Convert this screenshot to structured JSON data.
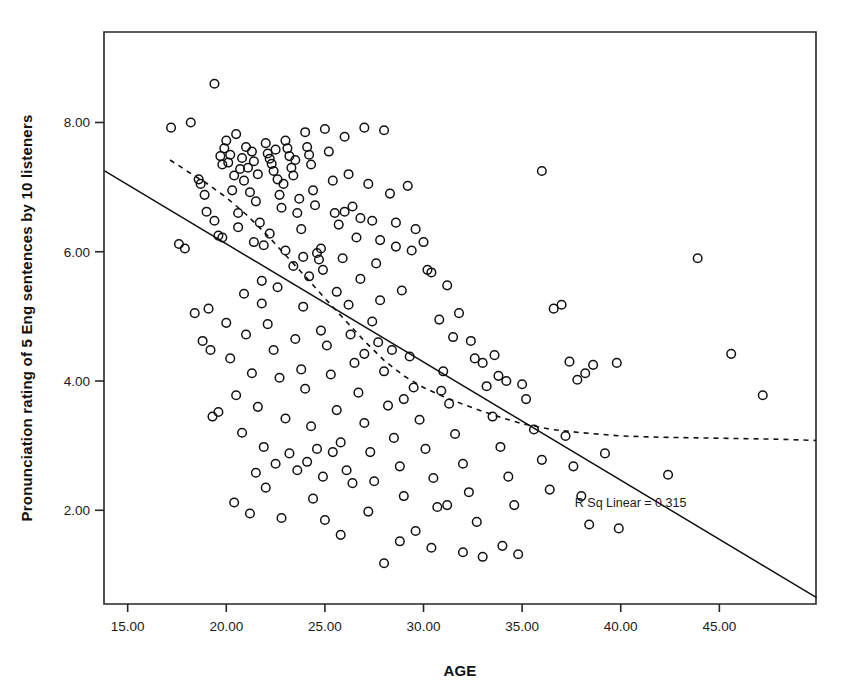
{
  "chart_data": {
    "type": "scatter",
    "title": "",
    "subtitle": "",
    "xlabel": "AGE",
    "ylabel": "Pronunciation rating of 5 Eng sentences by 10 listeners",
    "xlim": [
      13.8,
      49.9
    ],
    "ylim": [
      0.55,
      9.4
    ],
    "xticks": [
      15,
      20,
      25,
      30,
      35,
      40,
      45
    ],
    "xtick_labels": [
      "15.00",
      "20.00",
      "25.00",
      "30.00",
      "35.00",
      "40.00",
      "45.00"
    ],
    "yticks": [
      2,
      4,
      6,
      8
    ],
    "ytick_labels": [
      "2.00",
      "4.00",
      "6.00",
      "8.00"
    ],
    "grid": false,
    "legend": "none",
    "marker": "open-circle",
    "marker_color": "#111111",
    "annotations": [
      {
        "name": "r-squared-label",
        "text": "R Sq Linear = 0.315",
        "x": 40.5,
        "y": 2.05
      }
    ],
    "fit_line": {
      "name": "linear-fit",
      "style": "solid",
      "x": [
        13.83,
        49.93
      ],
      "y": [
        7.25,
        0.65
      ],
      "r_squared": 0.315
    },
    "loess_line": {
      "name": "loess-fit",
      "style": "dotted",
      "x": [
        17.15,
        18.0,
        19.0,
        20.0,
        21.0,
        22.0,
        23.0,
        24.0,
        25.0,
        26.0,
        27.0,
        28.0,
        29.0,
        30.0,
        31.0,
        32.0,
        33.0,
        34.0,
        35.0,
        36.5,
        38.0,
        40.0,
        42.0,
        44.0,
        46.0,
        48.0,
        49.9
      ],
      "y": [
        7.42,
        7.25,
        7.06,
        6.84,
        6.58,
        6.28,
        5.95,
        5.62,
        5.28,
        4.95,
        4.62,
        4.32,
        4.08,
        3.9,
        3.76,
        3.64,
        3.53,
        3.43,
        3.34,
        3.25,
        3.2,
        3.15,
        3.13,
        3.12,
        3.11,
        3.1,
        3.08
      ]
    },
    "points": [
      [
        17.2,
        7.92
      ],
      [
        17.6,
        6.12
      ],
      [
        17.9,
        6.05
      ],
      [
        18.2,
        8.0
      ],
      [
        18.6,
        7.12
      ],
      [
        18.7,
        7.05
      ],
      [
        18.9,
        6.88
      ],
      [
        19.1,
        5.12
      ],
      [
        19.3,
        3.45
      ],
      [
        19.4,
        8.6
      ],
      [
        19.6,
        6.25
      ],
      [
        19.7,
        7.48
      ],
      [
        19.8,
        7.35
      ],
      [
        19.9,
        7.6
      ],
      [
        20.0,
        7.72
      ],
      [
        20.1,
        7.38
      ],
      [
        20.2,
        7.5
      ],
      [
        20.3,
        6.95
      ],
      [
        20.4,
        7.18
      ],
      [
        20.5,
        7.82
      ],
      [
        20.6,
        6.6
      ],
      [
        20.7,
        7.28
      ],
      [
        20.8,
        7.45
      ],
      [
        20.9,
        7.1
      ],
      [
        21.0,
        7.62
      ],
      [
        21.1,
        7.3
      ],
      [
        21.2,
        6.92
      ],
      [
        21.3,
        7.55
      ],
      [
        21.4,
        7.4
      ],
      [
        21.5,
        6.78
      ],
      [
        21.6,
        7.2
      ],
      [
        21.7,
        6.45
      ],
      [
        21.8,
        5.55
      ],
      [
        21.9,
        6.1
      ],
      [
        22.0,
        7.68
      ],
      [
        22.1,
        7.52
      ],
      [
        22.2,
        7.44
      ],
      [
        22.3,
        7.36
      ],
      [
        22.4,
        7.25
      ],
      [
        22.5,
        7.58
      ],
      [
        22.6,
        7.12
      ],
      [
        22.7,
        6.88
      ],
      [
        22.8,
        6.68
      ],
      [
        22.9,
        7.05
      ],
      [
        23.0,
        7.72
      ],
      [
        23.1,
        7.6
      ],
      [
        23.2,
        7.48
      ],
      [
        23.3,
        7.3
      ],
      [
        23.4,
        7.18
      ],
      [
        23.5,
        7.42
      ],
      [
        23.6,
        6.6
      ],
      [
        23.7,
        6.82
      ],
      [
        23.8,
        6.35
      ],
      [
        23.9,
        5.92
      ],
      [
        24.0,
        7.85
      ],
      [
        24.1,
        7.62
      ],
      [
        24.2,
        7.5
      ],
      [
        24.3,
        7.35
      ],
      [
        24.4,
        6.95
      ],
      [
        24.5,
        6.72
      ],
      [
        24.6,
        5.98
      ],
      [
        24.7,
        5.88
      ],
      [
        24.8,
        6.05
      ],
      [
        24.9,
        5.72
      ],
      [
        25.0,
        7.9
      ],
      [
        25.2,
        7.55
      ],
      [
        25.4,
        7.1
      ],
      [
        25.5,
        6.6
      ],
      [
        25.7,
        6.42
      ],
      [
        25.9,
        5.9
      ],
      [
        26.0,
        7.78
      ],
      [
        26.2,
        7.2
      ],
      [
        26.4,
        6.7
      ],
      [
        26.6,
        6.22
      ],
      [
        26.8,
        5.58
      ],
      [
        27.0,
        7.92
      ],
      [
        27.2,
        7.05
      ],
      [
        27.4,
        6.48
      ],
      [
        27.6,
        5.82
      ],
      [
        27.8,
        5.25
      ],
      [
        28.0,
        7.88
      ],
      [
        28.3,
        6.9
      ],
      [
        28.6,
        6.08
      ],
      [
        28.9,
        5.4
      ],
      [
        29.2,
        7.02
      ],
      [
        29.6,
        6.35
      ],
      [
        30.0,
        6.15
      ],
      [
        30.4,
        5.68
      ],
      [
        30.8,
        4.95
      ],
      [
        31.2,
        5.48
      ],
      [
        31.8,
        5.05
      ],
      [
        32.4,
        4.62
      ],
      [
        33.0,
        4.28
      ],
      [
        33.6,
        4.4
      ],
      [
        34.2,
        4.0
      ],
      [
        35.0,
        3.95
      ],
      [
        36.0,
        7.25
      ],
      [
        36.6,
        5.12
      ],
      [
        37.0,
        5.18
      ],
      [
        37.4,
        4.3
      ],
      [
        37.8,
        4.02
      ],
      [
        38.2,
        4.12
      ],
      [
        38.6,
        4.25
      ],
      [
        39.8,
        4.28
      ],
      [
        39.9,
        1.72
      ],
      [
        42.4,
        2.55
      ],
      [
        43.9,
        5.9
      ],
      [
        45.6,
        4.42
      ],
      [
        47.2,
        3.78
      ],
      [
        18.4,
        5.05
      ],
      [
        18.8,
        4.62
      ],
      [
        19.2,
        4.48
      ],
      [
        19.6,
        3.52
      ],
      [
        20.0,
        4.9
      ],
      [
        20.2,
        4.35
      ],
      [
        20.5,
        3.78
      ],
      [
        20.8,
        3.2
      ],
      [
        21.0,
        4.72
      ],
      [
        21.3,
        4.12
      ],
      [
        21.6,
        3.6
      ],
      [
        21.9,
        2.98
      ],
      [
        22.1,
        4.88
      ],
      [
        22.4,
        4.48
      ],
      [
        22.7,
        4.05
      ],
      [
        23.0,
        3.42
      ],
      [
        23.2,
        2.88
      ],
      [
        23.5,
        4.65
      ],
      [
        23.8,
        4.18
      ],
      [
        24.0,
        3.88
      ],
      [
        24.3,
        3.3
      ],
      [
        24.6,
        2.95
      ],
      [
        24.9,
        2.52
      ],
      [
        25.1,
        4.55
      ],
      [
        25.3,
        4.1
      ],
      [
        25.6,
        3.55
      ],
      [
        25.8,
        3.05
      ],
      [
        26.1,
        2.62
      ],
      [
        26.3,
        4.72
      ],
      [
        26.5,
        4.28
      ],
      [
        26.7,
        3.82
      ],
      [
        27.0,
        3.35
      ],
      [
        27.3,
        2.9
      ],
      [
        27.5,
        2.45
      ],
      [
        27.7,
        4.6
      ],
      [
        28.0,
        4.15
      ],
      [
        28.2,
        3.62
      ],
      [
        28.5,
        3.12
      ],
      [
        28.8,
        2.68
      ],
      [
        29.0,
        2.22
      ],
      [
        29.3,
        4.38
      ],
      [
        29.5,
        3.9
      ],
      [
        29.8,
        3.4
      ],
      [
        30.1,
        2.95
      ],
      [
        30.5,
        2.5
      ],
      [
        30.7,
        2.05
      ],
      [
        31.0,
        4.15
      ],
      [
        31.3,
        3.65
      ],
      [
        31.6,
        3.18
      ],
      [
        32.0,
        2.72
      ],
      [
        32.3,
        2.28
      ],
      [
        32.7,
        1.82
      ],
      [
        33.2,
        3.92
      ],
      [
        33.5,
        3.45
      ],
      [
        33.9,
        2.98
      ],
      [
        34.3,
        2.52
      ],
      [
        34.6,
        2.08
      ],
      [
        35.2,
        3.72
      ],
      [
        35.6,
        3.25
      ],
      [
        36.0,
        2.78
      ],
      [
        36.4,
        2.32
      ],
      [
        37.2,
        3.15
      ],
      [
        37.6,
        2.68
      ],
      [
        38.0,
        2.22
      ],
      [
        38.4,
        1.78
      ],
      [
        39.2,
        2.88
      ],
      [
        20.4,
        2.12
      ],
      [
        21.2,
        1.95
      ],
      [
        22.0,
        2.35
      ],
      [
        22.8,
        1.88
      ],
      [
        23.6,
        2.62
      ],
      [
        24.4,
        2.18
      ],
      [
        25.0,
        1.85
      ],
      [
        25.8,
        1.62
      ],
      [
        26.4,
        2.42
      ],
      [
        27.2,
        1.98
      ],
      [
        28.0,
        1.18
      ],
      [
        28.8,
        1.52
      ],
      [
        29.6,
        1.68
      ],
      [
        30.4,
        1.42
      ],
      [
        31.2,
        2.08
      ],
      [
        32.0,
        1.35
      ],
      [
        33.0,
        1.28
      ],
      [
        34.0,
        1.45
      ],
      [
        34.8,
        1.32
      ],
      [
        19.0,
        6.62
      ],
      [
        19.4,
        6.48
      ],
      [
        19.8,
        6.22
      ],
      [
        20.6,
        6.38
      ],
      [
        21.4,
        6.15
      ],
      [
        22.2,
        6.28
      ],
      [
        23.0,
        6.02
      ],
      [
        23.4,
        5.78
      ],
      [
        24.2,
        5.62
      ],
      [
        25.6,
        5.38
      ],
      [
        26.2,
        5.18
      ],
      [
        27.4,
        4.92
      ],
      [
        22.6,
        5.45
      ],
      [
        23.9,
        5.15
      ],
      [
        20.9,
        5.35
      ],
      [
        21.8,
        5.2
      ],
      [
        24.8,
        4.78
      ],
      [
        26.0,
        6.62
      ],
      [
        26.8,
        6.52
      ],
      [
        27.8,
        6.18
      ],
      [
        28.6,
        6.45
      ],
      [
        29.4,
        6.02
      ],
      [
        30.2,
        5.72
      ],
      [
        31.5,
        4.68
      ],
      [
        32.6,
        4.35
      ],
      [
        33.8,
        4.08
      ],
      [
        30.9,
        3.85
      ],
      [
        29.0,
        3.72
      ],
      [
        28.4,
        4.48
      ],
      [
        27.0,
        4.42
      ],
      [
        25.4,
        2.9
      ],
      [
        24.1,
        2.75
      ],
      [
        22.5,
        2.72
      ],
      [
        21.5,
        2.58
      ]
    ]
  }
}
